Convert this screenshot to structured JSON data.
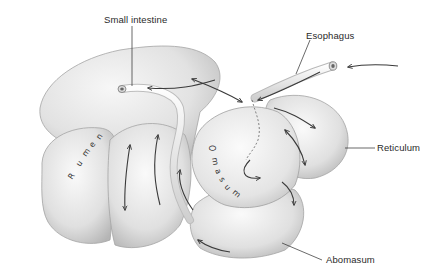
{
  "diagram": {
    "labels": {
      "small_intestine": "Small intestine",
      "esophagus": "Esophagus",
      "reticulum": "Reticulum",
      "abomasum": "Abomasum"
    },
    "organ_text": {
      "rumen": [
        "R",
        "u",
        "m",
        "e",
        "n"
      ],
      "omasum": [
        "O",
        "m",
        "a",
        "s",
        "u",
        "m"
      ]
    },
    "colors": {
      "background": "#ffffff",
      "organ_fill": "#e6e6e6",
      "organ_shadow": "#bdbdbd",
      "outline": "#9a9a9a",
      "arrow": "#3a3a3a",
      "leader_line": "#2a2a2a"
    }
  }
}
